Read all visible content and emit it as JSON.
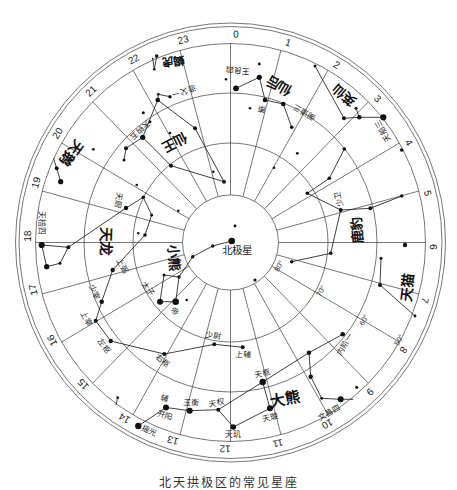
{
  "page": {
    "caption": "北天拱极区的常见星座"
  },
  "map": {
    "hour_labels": [
      "0",
      "1",
      "2",
      "3",
      "4",
      "5",
      "6",
      "7",
      "8",
      "9",
      "10",
      "11",
      "12",
      "13",
      "14",
      "15",
      "16",
      "17",
      "18",
      "19",
      "20",
      "21",
      "22",
      "23"
    ],
    "declination_labels": [
      {
        "text": "80°",
        "x": 279,
        "y": 266,
        "rot": -62
      },
      {
        "text": "70°",
        "x": 321,
        "y": 291,
        "rot": -62
      },
      {
        "text": "60°",
        "x": 364,
        "y": 320,
        "rot": -60
      },
      {
        "text": "50°",
        "x": 399,
        "y": 340,
        "rot": -60
      }
    ],
    "constellation_labels": [
      {
        "text": "天鹅",
        "x": 71.5,
        "y": 153,
        "rot": 126,
        "size": 14
      },
      {
        "text": "仙王",
        "x": 175,
        "y": 142,
        "rot": 153,
        "size": 13.5
      },
      {
        "text": "蝎虎",
        "x": 173.3,
        "y": 61,
        "rot": 172,
        "size": 11.5
      },
      {
        "text": "仙后",
        "x": 279,
        "y": 86,
        "rot": -150,
        "size": 13.5
      },
      {
        "text": "英仙",
        "x": 344,
        "y": 95,
        "rot": -139,
        "size": 13
      },
      {
        "text": "鹿豹",
        "x": 357,
        "y": 230,
        "rot": -95,
        "size": 13.5
      },
      {
        "text": "天猫",
        "x": 407.5,
        "y": 287.5,
        "rot": -83,
        "size": 14
      },
      {
        "text": "大熊",
        "x": 285,
        "y": 399,
        "rot": -10,
        "size": 15
      },
      {
        "text": "小熊",
        "x": 174,
        "y": 257.5,
        "rot": 85,
        "size": 13.5
      },
      {
        "text": "天龙",
        "x": 105.5,
        "y": 241,
        "rot": 92,
        "size": 14.5
      }
    ],
    "star_labels": [
      {
        "text": "北极星",
        "x": 237,
        "y": 250,
        "rot": 0,
        "size": 10.5
      },
      {
        "text": "太子",
        "x": 148,
        "y": 289,
        "rot": 55
      },
      {
        "text": "帝",
        "x": 174,
        "y": 311,
        "rot": 50
      },
      {
        "text": "上弼",
        "x": 122,
        "y": 266,
        "rot": 62
      },
      {
        "text": "天厨",
        "x": 118,
        "y": 200,
        "rot": 100
      },
      {
        "text": "天棓四",
        "x": 41.7,
        "y": 222.5,
        "rot": 90
      },
      {
        "text": "少宰",
        "x": 94,
        "y": 292,
        "rot": 68
      },
      {
        "text": "上宰",
        "x": 86,
        "y": 319,
        "rot": 62
      },
      {
        "text": "左枢",
        "x": 104,
        "y": 346,
        "rot": 52
      },
      {
        "text": "右枢",
        "x": 162.5,
        "y": 361,
        "rot": 38
      },
      {
        "text": "少尉",
        "x": 213,
        "y": 336,
        "rot": 8
      },
      {
        "text": "上辅",
        "x": 243,
        "y": 355,
        "rot": 4
      },
      {
        "text": "天枢",
        "x": 262.5,
        "y": 374,
        "rot": -12
      },
      {
        "text": "天璇",
        "x": 270,
        "y": 418,
        "rot": -15
      },
      {
        "text": "天权",
        "x": 217,
        "y": 403,
        "rot": -8
      },
      {
        "text": "天玑",
        "x": 233,
        "y": 434,
        "rot": 0
      },
      {
        "text": "玉衡",
        "x": 191,
        "y": 403,
        "rot": 5
      },
      {
        "text": "开阳",
        "x": 165,
        "y": 416,
        "rot": 15
      },
      {
        "text": "辅",
        "x": 165,
        "y": 399,
        "rot": 15
      },
      {
        "text": "摇光",
        "x": 149,
        "y": 431,
        "rot": 25
      },
      {
        "text": "文昌四",
        "x": 329,
        "y": 413,
        "rot": -30
      },
      {
        "text": "内阶一",
        "x": 345,
        "y": 344,
        "rot": -58
      },
      {
        "text": "少卫",
        "x": 339,
        "y": 199,
        "rot": -100
      },
      {
        "text": "天船三",
        "x": 383,
        "y": 131,
        "rot": -120
      },
      {
        "text": "阁道三",
        "x": 304,
        "y": 112,
        "rot": -150
      },
      {
        "text": "策",
        "x": 262,
        "y": 109,
        "rot": -170
      },
      {
        "text": "王良四",
        "x": 238,
        "y": 70,
        "rot": -175
      },
      {
        "text": "造父一",
        "x": 184,
        "y": 91,
        "rot": 165
      },
      {
        "text": "天钩五",
        "x": 140,
        "y": 130,
        "rot": 135
      }
    ],
    "stars": [
      {
        "id": "polaris",
        "x": 231.7,
        "y": 241,
        "r": 3.3
      },
      {
        "id": "umi_delta",
        "x": 212.7,
        "y": 246,
        "r": 1.7
      },
      {
        "id": "umi_eps",
        "x": 192.7,
        "y": 256.7,
        "r": 1.7
      },
      {
        "id": "umi_zeta",
        "x": 179,
        "y": 277,
        "r": 1.7
      },
      {
        "id": "umi_eta",
        "x": 164,
        "y": 275,
        "r": 1.5
      },
      {
        "id": "pherkad",
        "x": 160,
        "y": 301.7,
        "r": 3
      },
      {
        "id": "kochab",
        "x": 175.7,
        "y": 301.7,
        "r": 3.3
      },
      {
        "id": "s_umi1",
        "x": 186.7,
        "y": 300,
        "r": 1.3
      },
      {
        "id": "s_c1",
        "x": 235,
        "y": 226,
        "r": 1.4
      },
      {
        "id": "s_c2",
        "x": 255,
        "y": 280,
        "r": 1.6
      },
      {
        "id": "s_c3",
        "x": 178.3,
        "y": 210.7,
        "r": 1.3
      },
      {
        "id": "cep_alpha",
        "x": 142.7,
        "y": 137.3,
        "r": 2.6
      },
      {
        "id": "cep_beta",
        "x": 171,
        "y": 165.7,
        "r": 2
      },
      {
        "id": "cep_gamma",
        "x": 224,
        "y": 181.7,
        "r": 2
      },
      {
        "id": "cep_iota",
        "x": 195,
        "y": 128.3,
        "r": 2
      },
      {
        "id": "cep_zeta",
        "x": 157.7,
        "y": 100,
        "r": 2.3
      },
      {
        "id": "cep_delta",
        "x": 170,
        "y": 96.7,
        "r": 1.7
      },
      {
        "id": "cep_eps",
        "x": 158.3,
        "y": 94.3,
        "r": 1.4
      },
      {
        "id": "cep_mu",
        "x": 143.3,
        "y": 112.7,
        "r": 1.5
      },
      {
        "id": "cep_nu",
        "x": 150,
        "y": 121.7,
        "r": 1.5
      },
      {
        "id": "cep_eta",
        "x": 126,
        "y": 148.3,
        "r": 2
      },
      {
        "id": "cep_theta",
        "x": 124,
        "y": 160,
        "r": 1.5
      },
      {
        "id": "s_cep1",
        "x": 213.3,
        "y": 171.7,
        "r": 1.3
      },
      {
        "id": "s_cep2",
        "x": 170,
        "y": 133,
        "r": 1.3
      },
      {
        "id": "lac_a",
        "x": 156.7,
        "y": 56,
        "r": 1.8
      },
      {
        "id": "lac_b",
        "x": 154.3,
        "y": 69.3,
        "r": 1.3
      },
      {
        "id": "lac_c",
        "x": 152.7,
        "y": 58.5,
        "r": 0.8
      },
      {
        "id": "cyg_kappa",
        "x": 60.7,
        "y": 181.7,
        "r": 2.6
      },
      {
        "id": "cyg_iota",
        "x": 56.7,
        "y": 168.3,
        "r": 2
      },
      {
        "id": "cyg_end",
        "x": 53.5,
        "y": 158,
        "r": 0
      },
      {
        "id": "s_cyg1",
        "x": 93.3,
        "y": 149.3,
        "r": 1.4
      },
      {
        "id": "caph",
        "x": 236,
        "y": 88.3,
        "r": 2.9
      },
      {
        "id": "schedar",
        "x": 259.3,
        "y": 77.3,
        "r": 2.6
      },
      {
        "id": "cas_gamma",
        "x": 265,
        "y": 100,
        "r": 2.3
      },
      {
        "id": "cas_delta",
        "x": 283.3,
        "y": 104,
        "r": 2.3
      },
      {
        "id": "cas_eps",
        "x": 291.7,
        "y": 127.3,
        "r": 1.8
      },
      {
        "id": "cas_zeta",
        "x": 259.3,
        "y": 64,
        "r": 1.4
      },
      {
        "id": "s_cas1",
        "x": 226,
        "y": 79.3,
        "r": 1.3
      },
      {
        "id": "cas_kappa",
        "x": 250,
        "y": 108.3,
        "r": 1.3
      },
      {
        "id": "s_cas2",
        "x": 274,
        "y": 167.7,
        "r": 1.3
      },
      {
        "id": "per_1",
        "x": 315,
        "y": 66,
        "r": 1.5
      },
      {
        "id": "per_eta",
        "x": 344,
        "y": 118.3,
        "r": 2
      },
      {
        "id": "per_gamma",
        "x": 359.3,
        "y": 117.3,
        "r": 2.3
      },
      {
        "id": "mirfak",
        "x": 383.3,
        "y": 117.3,
        "r": 3.1
      },
      {
        "id": "per_tau",
        "x": 356,
        "y": 108.3,
        "r": 1.5
      },
      {
        "id": "cam_1",
        "x": 344.3,
        "y": 149,
        "r": 1.8
      },
      {
        "id": "cam_2",
        "x": 329.3,
        "y": 178.3,
        "r": 1.8
      },
      {
        "id": "cam_gamma",
        "x": 307.3,
        "y": 193.3,
        "r": 1.8
      },
      {
        "id": "cam_alpha",
        "x": 340.7,
        "y": 210,
        "r": 2
      },
      {
        "id": "cam_beta",
        "x": 370.3,
        "y": 208.3,
        "r": 2
      },
      {
        "id": "cam_3",
        "x": 401.7,
        "y": 196,
        "r": 1.8
      },
      {
        "id": "cam_4",
        "x": 330.7,
        "y": 253.3,
        "r": 1.8
      },
      {
        "id": "cam_5",
        "x": 291.7,
        "y": 261.7,
        "r": 1.8
      },
      {
        "id": "s_cam1",
        "x": 401.7,
        "y": 150,
        "r": 1.8
      },
      {
        "id": "s_cam2",
        "x": 297.3,
        "y": 153.3,
        "r": 1.4
      },
      {
        "id": "s_r6",
        "x": 405,
        "y": 245,
        "r": 2.2
      },
      {
        "id": "lyn_1",
        "x": 381,
        "y": 258.3,
        "r": 1.5
      },
      {
        "id": "lyn_2",
        "x": 380,
        "y": 285,
        "r": 2
      },
      {
        "id": "lyn_3",
        "x": 415,
        "y": 316,
        "r": 1.4
      },
      {
        "id": "dubhe",
        "x": 262.7,
        "y": 382,
        "r": 3.2
      },
      {
        "id": "merak",
        "x": 270,
        "y": 408.3,
        "r": 3
      },
      {
        "id": "phecda",
        "x": 233.3,
        "y": 427,
        "r": 2.8
      },
      {
        "id": "megrez",
        "x": 218.3,
        "y": 409.7,
        "r": 2
      },
      {
        "id": "alioth",
        "x": 189.7,
        "y": 410.7,
        "r": 3
      },
      {
        "id": "mizar",
        "x": 166,
        "y": 407.5,
        "r": 3
      },
      {
        "id": "alkaid",
        "x": 138.3,
        "y": 426,
        "r": 3.2
      },
      {
        "id": "uma_23",
        "x": 309,
        "y": 352.7,
        "r": 2.2
      },
      {
        "id": "uma_omicron",
        "x": 342.7,
        "y": 334.3,
        "r": 2.3
      },
      {
        "id": "uma_upsilon",
        "x": 310.7,
        "y": 376.7,
        "r": 2.2
      },
      {
        "id": "uma_phi",
        "x": 321.7,
        "y": 398.3,
        "r": 1.5
      },
      {
        "id": "uma_theta",
        "x": 340.7,
        "y": 399.3,
        "r": 3
      },
      {
        "id": "uma_end",
        "x": 353.3,
        "y": 399.3,
        "r": 0
      },
      {
        "id": "s_uma1",
        "x": 356.7,
        "y": 387.3,
        "r": 1.5
      },
      {
        "id": "s_bl1",
        "x": 117.7,
        "y": 397.7,
        "r": 1.4
      },
      {
        "id": "s_bl1_end",
        "x": 116,
        "y": 405,
        "r": 0
      },
      {
        "id": "eltanin",
        "x": 41.7,
        "y": 245,
        "r": 3.1
      },
      {
        "id": "dra_xi",
        "x": 68.3,
        "y": 247.3,
        "r": 2
      },
      {
        "id": "dra_nu",
        "x": 60,
        "y": 263.3,
        "r": 1.5
      },
      {
        "id": "rastaban",
        "x": 46.7,
        "y": 266.7,
        "r": 2.6
      },
      {
        "id": "dra_delta",
        "x": 126,
        "y": 208,
        "r": 2.2
      },
      {
        "id": "dra_eps",
        "x": 143.3,
        "y": 197.3,
        "r": 1.8
      },
      {
        "id": "dra_tau",
        "x": 151.7,
        "y": 215,
        "r": 1.5
      },
      {
        "id": "dra_chi",
        "x": 145,
        "y": 235,
        "r": 1.8
      },
      {
        "id": "dra_phi",
        "x": 138.3,
        "y": 233.3,
        "r": 1.2
      },
      {
        "id": "dra_zeta",
        "x": 112.7,
        "y": 270,
        "r": 2.2
      },
      {
        "id": "dra_eta",
        "x": 101.7,
        "y": 301.7,
        "r": 2.3
      },
      {
        "id": "dra_theta",
        "x": 95.7,
        "y": 320.7,
        "r": 2
      },
      {
        "id": "dra_iota",
        "x": 110.7,
        "y": 341,
        "r": 2.2
      },
      {
        "id": "thuban",
        "x": 164.3,
        "y": 354,
        "r": 2
      },
      {
        "id": "dra_kappa",
        "x": 214.3,
        "y": 344.3,
        "r": 2
      },
      {
        "id": "dra_lambda",
        "x": 242.7,
        "y": 347.3,
        "r": 2
      },
      {
        "id": "s_dra1",
        "x": 136.7,
        "y": 185,
        "r": 1.3
      }
    ],
    "figure_lines": [
      [
        "polaris",
        "umi_delta"
      ],
      [
        "umi_delta",
        "umi_eps"
      ],
      [
        "umi_eps",
        "umi_zeta"
      ],
      [
        "umi_zeta",
        "kochab"
      ],
      [
        "kochab",
        "pherkad"
      ],
      [
        "pherkad",
        "umi_eta"
      ],
      [
        "umi_eta",
        "umi_zeta"
      ],
      [
        "cep_zeta",
        "cep_iota"
      ],
      [
        "cep_iota",
        "cep_gamma"
      ],
      [
        "cep_gamma",
        "cep_beta"
      ],
      [
        "cep_beta",
        "cep_alpha"
      ],
      [
        "cep_alpha",
        "cep_zeta"
      ],
      [
        "cep_alpha",
        "cep_eta"
      ],
      [
        "cep_eta",
        "cep_theta"
      ],
      [
        "cep_zeta",
        "cep_eps"
      ],
      [
        "cep_eps",
        "cep_delta"
      ],
      [
        "lac_c",
        "lac_b"
      ],
      [
        "lac_b",
        "lac_a"
      ],
      [
        "cyg_end",
        "cyg_iota"
      ],
      [
        "cyg_iota",
        "cyg_kappa"
      ],
      [
        "caph",
        "schedar"
      ],
      [
        "schedar",
        "cas_gamma"
      ],
      [
        "cas_gamma",
        "cas_delta"
      ],
      [
        "cas_delta",
        "cas_eps"
      ],
      [
        "per_1",
        "per_eta"
      ],
      [
        "per_eta",
        "per_gamma"
      ],
      [
        "per_gamma",
        "mirfak"
      ],
      [
        "per_tau",
        "per_gamma"
      ],
      [
        "cam_1",
        "cam_2"
      ],
      [
        "cam_2",
        "cam_gamma"
      ],
      [
        "cam_gamma",
        "cam_alpha"
      ],
      [
        "cam_alpha",
        "cam_beta"
      ],
      [
        "cam_beta",
        "cam_3"
      ],
      [
        "cam_alpha",
        "cam_4"
      ],
      [
        "cam_4",
        "cam_5"
      ],
      [
        "lyn_1",
        "lyn_2"
      ],
      [
        "lyn_2",
        "lyn_3"
      ],
      [
        "dubhe",
        "merak"
      ],
      [
        "merak",
        "phecda"
      ],
      [
        "phecda",
        "megrez"
      ],
      [
        "megrez",
        "dubhe"
      ],
      [
        "megrez",
        "alioth"
      ],
      [
        "alioth",
        "mizar"
      ],
      [
        "mizar",
        "alkaid"
      ],
      [
        "dubhe",
        "uma_23"
      ],
      [
        "uma_23",
        "uma_omicron"
      ],
      [
        "uma_23",
        "uma_upsilon"
      ],
      [
        "uma_upsilon",
        "uma_phi"
      ],
      [
        "uma_phi",
        "uma_theta"
      ],
      [
        "uma_theta",
        "uma_end"
      ],
      [
        "s_bl1",
        "s_bl1_end"
      ],
      [
        "eltanin",
        "dra_xi"
      ],
      [
        "dra_xi",
        "dra_nu"
      ],
      [
        "dra_nu",
        "rastaban"
      ],
      [
        "rastaban",
        "eltanin"
      ],
      [
        "dra_xi",
        "dra_delta"
      ],
      [
        "dra_delta",
        "dra_eps"
      ],
      [
        "dra_eps",
        "dra_tau"
      ],
      [
        "dra_tau",
        "dra_chi"
      ],
      [
        "dra_chi",
        "dra_zeta"
      ],
      [
        "dra_zeta",
        "dra_eta"
      ],
      [
        "dra_eta",
        "dra_theta"
      ],
      [
        "dra_theta",
        "dra_iota"
      ],
      [
        "dra_iota",
        "thuban"
      ],
      [
        "thuban",
        "dra_kappa"
      ],
      [
        "dra_kappa",
        "dra_lambda"
      ]
    ]
  }
}
